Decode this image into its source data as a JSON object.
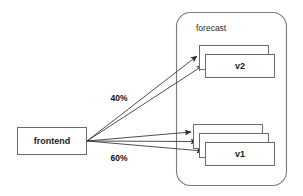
{
  "diagram": {
    "background_color": "#ffffff",
    "stroke_color": "#6b6b6b",
    "text_color": "#1a1a1a",
    "nodes": [
      {
        "id": "frontend",
        "label": "frontend",
        "shape": "rectangle",
        "x": 17,
        "y": 127,
        "width": 70,
        "height": 28,
        "stack_count": 1
      },
      {
        "id": "v2",
        "label": "v2",
        "shape": "stacked-rectangle",
        "x": 205,
        "y": 54,
        "width": 70,
        "height": 24,
        "stack_count": 2,
        "stack_offset": 6
      },
      {
        "id": "v1",
        "label": "v1",
        "shape": "stacked-rectangle",
        "x": 205,
        "y": 142,
        "width": 70,
        "height": 24,
        "stack_count": 3,
        "stack_offset": 6
      }
    ],
    "container": {
      "id": "forecast",
      "label": "forecast",
      "shape": "rounded-rectangle",
      "x": 176,
      "y": 12,
      "width": 111,
      "height": 174,
      "corner_radius": 14,
      "label_x": 196,
      "label_y": 29
    },
    "edges": [
      {
        "id": "frontend-to-v2-back",
        "from": "frontend",
        "to": "v2",
        "label": "",
        "x1": 87,
        "y1": 141,
        "x2": 197,
        "y2": 56
      },
      {
        "id": "frontend-to-v2-front",
        "from": "frontend",
        "to": "v2",
        "label": "40%",
        "x1": 87,
        "y1": 141,
        "x2": 203,
        "y2": 65
      },
      {
        "id": "frontend-to-v1-back",
        "from": "frontend",
        "to": "v1",
        "label": "",
        "x1": 87,
        "y1": 141,
        "x2": 191,
        "y2": 132
      },
      {
        "id": "frontend-to-v1-mid",
        "from": "frontend",
        "to": "v1",
        "label": "",
        "x1": 87,
        "y1": 141,
        "x2": 197,
        "y2": 141
      },
      {
        "id": "frontend-to-v1-front",
        "from": "frontend",
        "to": "v1",
        "label": "60%",
        "x1": 87,
        "y1": 141,
        "x2": 203,
        "y2": 151
      }
    ],
    "edge_labels": [
      {
        "id": "label-40",
        "text": "40%",
        "x": 119,
        "y": 99
      },
      {
        "id": "label-60",
        "text": "60%",
        "x": 119,
        "y": 159
      }
    ]
  }
}
